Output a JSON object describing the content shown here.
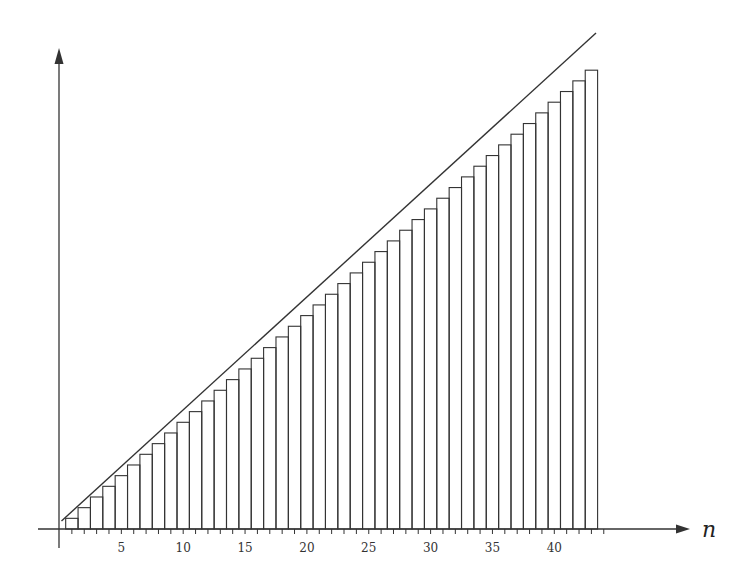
{
  "chart_data": {
    "type": "bar",
    "title": "",
    "xlabel": "n",
    "ylabel": "",
    "x": [
      1,
      2,
      3,
      4,
      5,
      6,
      7,
      8,
      9,
      10,
      11,
      12,
      13,
      14,
      15,
      16,
      17,
      18,
      19,
      20,
      21,
      22,
      23,
      24,
      25,
      26,
      27,
      28,
      29,
      30,
      31,
      32,
      33,
      34,
      35,
      36,
      37,
      38,
      39,
      40,
      41,
      42,
      43
    ],
    "values": [
      1,
      2,
      3,
      4,
      5,
      6,
      7,
      8,
      9,
      10,
      11,
      12,
      13,
      14,
      15,
      16,
      17,
      18,
      19,
      20,
      21,
      22,
      23,
      24,
      25,
      26,
      27,
      28,
      29,
      30,
      31,
      32,
      33,
      34,
      35,
      36,
      37,
      38,
      39,
      40,
      41,
      42,
      43
    ],
    "xticks_labeled": [
      5,
      10,
      15,
      20,
      25,
      30,
      35,
      40
    ],
    "xlim": [
      0,
      45
    ],
    "grid": false,
    "legend": null,
    "annotations": [
      {
        "type": "line",
        "description": "straight line through origin lying above the staircase of bars (y = n)",
        "from": [
          0,
          0
        ],
        "to": [
          43.3,
          45.8
        ]
      }
    ]
  },
  "axes": {
    "x_label": "n",
    "tick_labels": [
      "5",
      "10",
      "15",
      "20",
      "25",
      "30",
      "35",
      "40"
    ]
  },
  "colors": {
    "stroke": "#333333",
    "background": "#ffffff"
  }
}
